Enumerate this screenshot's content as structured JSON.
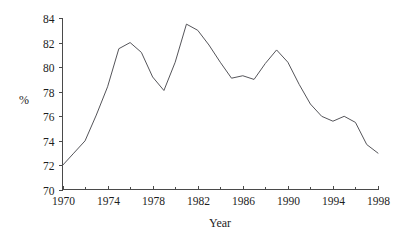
{
  "chart_data": {
    "type": "line",
    "title": "",
    "xlabel": "Year",
    "ylabel": "%",
    "xlim": [
      1970,
      1998
    ],
    "ylim": [
      70,
      84
    ],
    "grid": false,
    "legend": null,
    "x_tick_labels": [
      "1970",
      "1974",
      "1978",
      "1982",
      "1986",
      "1990",
      "1994",
      "1998"
    ],
    "x_tick_values": [
      1970,
      1974,
      1978,
      1982,
      1986,
      1990,
      1994,
      1998
    ],
    "x_minor_tick_values": [
      1972,
      1976,
      1980,
      1984,
      1988,
      1992,
      1996
    ],
    "y_tick_labels": [
      "70",
      "72",
      "74",
      "76",
      "78",
      "80",
      "82",
      "84"
    ],
    "y_tick_values": [
      70,
      72,
      74,
      76,
      78,
      80,
      82,
      84
    ],
    "x": [
      1970,
      1971,
      1972,
      1973,
      1974,
      1975,
      1976,
      1977,
      1978,
      1979,
      1980,
      1981,
      1982,
      1983,
      1984,
      1985,
      1986,
      1987,
      1988,
      1989,
      1990,
      1991,
      1992,
      1993,
      1994,
      1995,
      1996,
      1997,
      1998
    ],
    "values": [
      72.0,
      73.0,
      74.0,
      76.1,
      78.4,
      81.5,
      82.0,
      81.2,
      79.2,
      78.1,
      80.4,
      83.5,
      83.0,
      81.8,
      80.4,
      79.1,
      79.3,
      79.0,
      80.3,
      81.4,
      80.4,
      78.6,
      77.0,
      76.0,
      75.6,
      76.0,
      75.5,
      73.7,
      73.0
    ],
    "series": [
      {
        "name": "percent",
        "color": "#55555a",
        "values": [
          72.0,
          73.0,
          74.0,
          76.1,
          78.4,
          81.5,
          82.0,
          81.2,
          79.2,
          78.1,
          80.4,
          83.5,
          83.0,
          81.8,
          80.4,
          79.1,
          79.3,
          79.0,
          80.3,
          81.4,
          80.4,
          78.6,
          77.0,
          76.0,
          75.6,
          76.0,
          75.5,
          73.7,
          73.0
        ]
      }
    ]
  },
  "axis": {
    "x_title": "Year",
    "y_title": "%"
  }
}
